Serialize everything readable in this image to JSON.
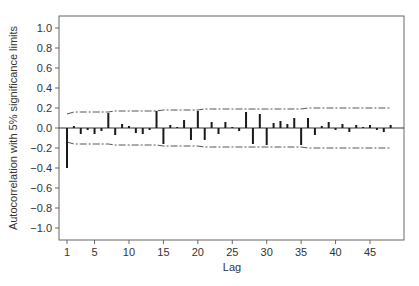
{
  "chart_data": {
    "type": "bar",
    "title": "",
    "xlabel": "Lag",
    "ylabel": "Autocorrelation with 5% significance limits",
    "xlim": [
      0,
      49.5
    ],
    "ylim": [
      -1.1,
      1.1
    ],
    "xticks": [
      1,
      5,
      10,
      15,
      20,
      25,
      30,
      35,
      40,
      45
    ],
    "yticks": [
      1.0,
      0.8,
      0.6,
      0.4,
      0.2,
      0.0,
      -0.2,
      -0.4,
      -0.6,
      -0.8,
      -1.0
    ],
    "ytick_labels": [
      "1.0",
      "0.8",
      "0.6",
      "0.4",
      "0.2",
      "0.0",
      "−0.2",
      "−0.4",
      "−0.6",
      "−0.8",
      "−1.0"
    ],
    "grid": false,
    "legend": null,
    "x": [
      1,
      2,
      3,
      4,
      5,
      6,
      7,
      8,
      9,
      10,
      11,
      12,
      13,
      14,
      15,
      16,
      17,
      18,
      19,
      20,
      21,
      22,
      23,
      24,
      25,
      26,
      27,
      28,
      29,
      30,
      31,
      32,
      33,
      34,
      35,
      36,
      37,
      38,
      39,
      40,
      41,
      42,
      43,
      44,
      45,
      46,
      47,
      48
    ],
    "values": [
      -0.4,
      0.02,
      -0.06,
      -0.02,
      -0.06,
      -0.03,
      0.15,
      -0.07,
      0.04,
      0.02,
      -0.05,
      -0.06,
      -0.02,
      0.17,
      -0.16,
      0.03,
      0.01,
      0.08,
      -0.12,
      0.17,
      -0.12,
      0.06,
      -0.06,
      0.06,
      0.01,
      -0.03,
      0.16,
      -0.16,
      0.14,
      -0.17,
      0.05,
      0.07,
      0.04,
      0.1,
      -0.17,
      0.1,
      -0.07,
      0.02,
      0.06,
      -0.02,
      0.04,
      -0.04,
      0.03,
      0.01,
      0.03,
      -0.02,
      -0.04,
      0.03
    ],
    "significance_limits": {
      "upper": [
        0.14,
        0.16,
        0.16,
        0.16,
        0.16,
        0.16,
        0.16,
        0.17,
        0.17,
        0.17,
        0.17,
        0.17,
        0.17,
        0.17,
        0.18,
        0.18,
        0.18,
        0.18,
        0.18,
        0.18,
        0.19,
        0.19,
        0.19,
        0.19,
        0.19,
        0.19,
        0.19,
        0.19,
        0.19,
        0.19,
        0.19,
        0.19,
        0.19,
        0.19,
        0.19,
        0.2,
        0.2,
        0.2,
        0.2,
        0.2,
        0.2,
        0.2,
        0.2,
        0.2,
        0.2,
        0.2,
        0.2,
        0.2
      ],
      "style": "dash-dot",
      "symmetric": true
    },
    "colors": {
      "bar": "#1a1a1a",
      "limits": "#555555",
      "axis": "#555555",
      "zero_line": "#333333"
    }
  }
}
